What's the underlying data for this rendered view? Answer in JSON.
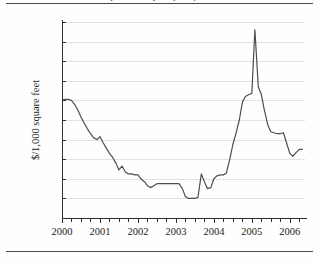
{
  "figure": {
    "title_partial": "price index per square foot",
    "y_axis_title": "$/1,000 square feet",
    "line_color": "#4d4d4d",
    "grid_color": "#e2e2e2",
    "axis_color": "#2e2e2e"
  },
  "chart_data": {
    "type": "line",
    "title": "",
    "xlabel": "",
    "ylabel": "$/1,000 square feet",
    "xlim": [
      2000.0,
      2006.4
    ],
    "ylim": [
      110,
      310
    ],
    "ytick_labels": [
      "310",
      "290",
      "270",
      "250",
      "230",
      "210",
      "190",
      "170",
      "150",
      "130",
      "110"
    ],
    "ytick_values": [
      310,
      290,
      270,
      250,
      230,
      210,
      190,
      170,
      150,
      130,
      110
    ],
    "xtick_labels": [
      "2000",
      "2001",
      "2002",
      "2003",
      "2004",
      "2005",
      "2006"
    ],
    "xtick_values": [
      2000,
      2001,
      2002,
      2003,
      2004,
      2005,
      2006
    ],
    "minor_xtick_interval": 0.25,
    "grid": true,
    "legend": "none",
    "series": [
      {
        "name": "price per 1,000 square feet",
        "x": [
          2000.0,
          2000.08,
          2000.17,
          2000.25,
          2000.33,
          2000.42,
          2000.5,
          2000.58,
          2000.67,
          2000.75,
          2000.83,
          2000.92,
          2001.0,
          2001.08,
          2001.17,
          2001.25,
          2001.33,
          2001.42,
          2001.5,
          2001.58,
          2001.67,
          2001.75,
          2001.83,
          2001.92,
          2002.0,
          2002.08,
          2002.17,
          2002.25,
          2002.33,
          2002.42,
          2002.5,
          2002.58,
          2002.67,
          2002.75,
          2002.83,
          2002.92,
          2003.0,
          2003.08,
          2003.17,
          2003.25,
          2003.33,
          2003.42,
          2003.5,
          2003.58,
          2003.67,
          2003.75,
          2003.83,
          2003.92,
          2004.0,
          2004.08,
          2004.17,
          2004.25,
          2004.33,
          2004.42,
          2004.5,
          2004.58,
          2004.67,
          2004.75,
          2004.83,
          2004.92,
          2005.0,
          2005.08,
          2005.17,
          2005.25,
          2005.33,
          2005.42,
          2005.5,
          2005.58,
          2005.67,
          2005.75,
          2005.83,
          2005.92,
          2006.0,
          2006.08,
          2006.17,
          2006.25,
          2006.33
        ],
        "y": [
          230,
          231,
          231,
          230,
          226,
          220,
          213,
          207,
          201,
          196,
          192,
          190,
          193,
          187,
          181,
          176,
          172,
          166,
          159,
          163,
          157,
          155,
          155,
          154,
          154,
          150,
          147,
          143,
          141,
          143,
          145,
          145,
          145,
          145,
          145,
          145,
          145,
          145,
          140,
          132,
          130,
          130,
          130,
          131,
          155,
          147,
          140,
          141,
          150,
          153,
          154,
          154,
          156,
          170,
          185,
          196,
          210,
          228,
          234,
          236,
          237,
          302,
          244,
          236,
          220,
          205,
          198,
          197,
          196,
          196,
          197,
          186,
          176,
          173,
          177,
          180,
          180
        ]
      }
    ],
    "annotations": [
      {
        "label": "start level",
        "value": 230,
        "x": 2000.0
      },
      {
        "label": "trough",
        "value": 130,
        "x": 2003.2
      },
      {
        "label": "peak spike",
        "value": 302,
        "x": 2005.1
      },
      {
        "label": "end level",
        "value": 270,
        "x": 2006.4
      }
    ]
  }
}
